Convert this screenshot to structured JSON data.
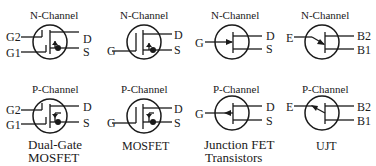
{
  "diagram": {
    "rows": [
      {
        "channel_label": "N-Channel"
      },
      {
        "channel_label": "P-Channel"
      }
    ],
    "columns": [
      {
        "name": "Dual-Gate MOSFET",
        "caption_line1": "Dual-Gate",
        "caption_line2": "MOSFET",
        "terminals": {
          "gate2": "G2",
          "gate1": "G1",
          "drain": "D",
          "source": "S"
        }
      },
      {
        "name": "MOSFET",
        "caption_line1": "MOSFET",
        "terminals": {
          "gate": "G",
          "drain": "D",
          "source": "S"
        }
      },
      {
        "name": "Junction FET Transistors",
        "caption_line1": "Junction FET",
        "caption_line2": "Transistors",
        "terminals": {
          "gate": "G",
          "drain": "D",
          "source": "S"
        }
      },
      {
        "name": "UJT",
        "caption_line1": "UJT",
        "terminals": {
          "emitter": "E",
          "base2": "B2",
          "base1": "B1"
        }
      }
    ],
    "colors": {
      "line": "#1a1a1a",
      "background": "#ffffff"
    }
  }
}
